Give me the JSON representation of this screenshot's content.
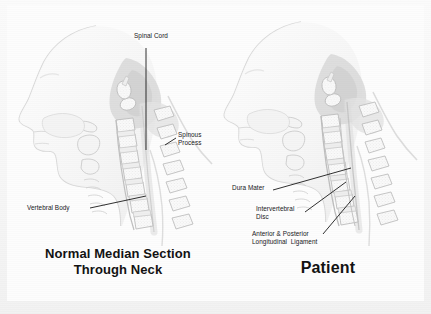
{
  "slide": {
    "background_color": "#fdfdfd",
    "ink_color": "#17181a"
  },
  "panels": [
    {
      "id": "normal",
      "caption_line1": "Normal Median Section",
      "caption_line2": "Through Neck",
      "caption": "Normal Median Section\nThrough Neck",
      "labels": [
        {
          "id": "spinal-cord",
          "text": "Spinal Cord"
        },
        {
          "id": "spinous-process",
          "text": "Spinous\nProcess",
          "line1": "Spinous",
          "line2": "Process"
        },
        {
          "id": "vertebral-body",
          "text": "Vertebral Body"
        }
      ]
    },
    {
      "id": "patient",
      "caption_line1": "Patient",
      "caption_line2": "",
      "caption": "Patient",
      "labels": [
        {
          "id": "dura-mater",
          "text": "Dura Mater"
        },
        {
          "id": "intervertebral-disc",
          "text": "Intervertebral\nDisc",
          "line1": "Intervertebral",
          "line2": "Disc"
        },
        {
          "id": "longitudinal-ligament",
          "text": "Anterior & Posterior\nLongitudinal Ligament",
          "line1": "Anterior & Posterior",
          "line2": "Longitudinal  Ligament"
        }
      ]
    }
  ],
  "figure": {
    "type": "anatomical-illustration",
    "style": "faint grayscale line drawing",
    "views": 2
  }
}
